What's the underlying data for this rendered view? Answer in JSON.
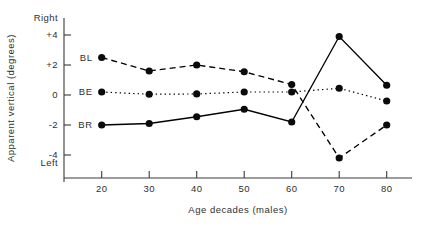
{
  "chart_data": {
    "type": "line",
    "title": "",
    "xlabel": "Age decades (males)",
    "ylabel": "Apparent vertical (degrees)",
    "categories": [
      20,
      30,
      40,
      50,
      60,
      70,
      80
    ],
    "xtick_labels": [
      "20",
      "30",
      "40",
      "50",
      "60",
      "70",
      "80"
    ],
    "ytick_labels": [
      "+4",
      "+2",
      "0",
      "-2",
      "-4"
    ],
    "ytick_values": [
      4,
      2,
      0,
      -2,
      -4
    ],
    "ylim": [
      -5.2,
      5.2
    ],
    "xlim": [
      15,
      85
    ],
    "axis_end_labels": {
      "top": "Right",
      "bottom": "Left"
    },
    "grid": false,
    "legend_position": "inline-left",
    "series": [
      {
        "name": "BL",
        "style": "dashed",
        "marker": "filled-circle",
        "values": [
          2.5,
          1.6,
          2.0,
          1.55,
          0.7,
          -4.2,
          -2.0
        ]
      },
      {
        "name": "BE",
        "style": "dotted",
        "marker": "filled-circle",
        "values": [
          0.2,
          0.05,
          0.07,
          0.2,
          0.2,
          0.45,
          -0.4
        ]
      },
      {
        "name": "BR",
        "style": "solid",
        "marker": "filled-circle",
        "values": [
          -2.0,
          -1.9,
          -1.45,
          -0.95,
          -1.8,
          3.9,
          0.65
        ]
      }
    ],
    "colors": {
      "ink": "#0b0b0b",
      "axis": "#3a3a3a",
      "background": "#ffffff"
    }
  }
}
